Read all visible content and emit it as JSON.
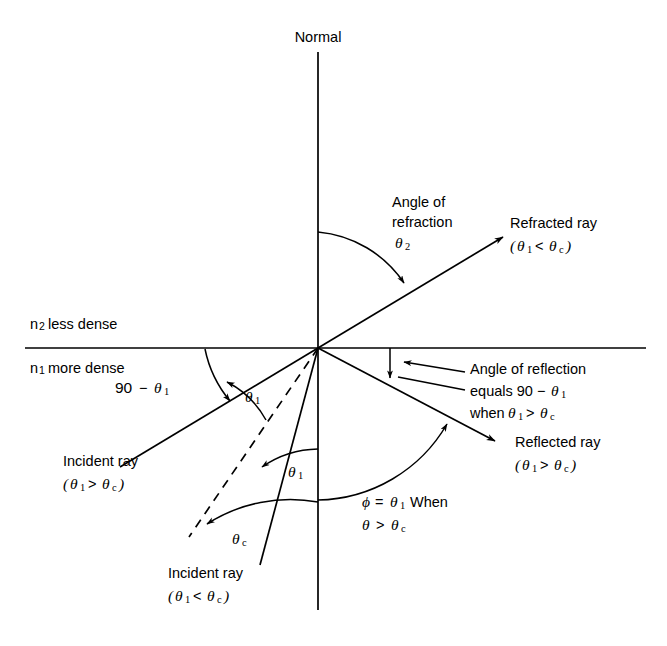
{
  "figure": {
    "background_color": "#ffffff",
    "stroke_color": "#000000"
  },
  "labels": {
    "normal": "Normal",
    "medium_upper": {
      "symbol": "n",
      "subscript": "2",
      "text": "less dense"
    },
    "medium_lower": {
      "symbol": "n",
      "subscript": "1",
      "text": "more dense"
    },
    "angle_of_refraction": {
      "line1": "Angle of",
      "line2": "refraction",
      "symbol": "θ",
      "subscript": "2"
    },
    "refracted_ray": {
      "line1": "Refracted ray",
      "open_paren": "(",
      "theta": "θ",
      "sub1": "1",
      "operator": "<",
      "theta2": "θ",
      "sub2": "c",
      "close_paren": ")"
    },
    "reflected_ray": {
      "line1": "Reflected ray",
      "open_paren": "(",
      "theta": "θ",
      "sub1": "1",
      "operator": ">",
      "theta2": "θ",
      "sub2": "c",
      "close_paren": ")"
    },
    "angle_of_reflection": {
      "line1": "Angle of reflection",
      "line2_prefix": "equals 90",
      "line2_minus": "−",
      "line2_theta": "θ",
      "line2_sub": "1",
      "line3_prefix": "when",
      "line3_theta": "θ",
      "line3_sub1": "1",
      "line3_op": ">",
      "line3_theta2": "θ",
      "line3_sub2": "c"
    },
    "ninety_minus_theta1": {
      "number": "90",
      "minus": "−",
      "theta": "θ",
      "subscript": "1"
    },
    "theta1_upper": {
      "theta": "θ",
      "subscript": "1"
    },
    "theta1_lower": {
      "theta": "θ",
      "subscript": "1"
    },
    "theta_c": {
      "theta": "θ",
      "subscript": "c"
    },
    "incident_ray_gt": {
      "line1": "Incident ray",
      "open_paren": "(",
      "theta": "θ",
      "sub1": "1",
      "operator": ">",
      "theta2": "θ",
      "sub2": "c",
      "close_paren": ")"
    },
    "incident_ray_lt": {
      "line1": "Incident ray",
      "open_paren": "(",
      "theta": "θ",
      "sub1": "1",
      "operator": "<",
      "theta2": "θ",
      "sub2": "c",
      "close_paren": ")"
    },
    "phi_note": {
      "phi": "ϕ",
      "equals": "=",
      "theta": "θ",
      "sub1": "1",
      "when": "When",
      "line2_theta": "θ",
      "line2_op": ">",
      "line2_theta2": "θ",
      "line2_sub": "c"
    }
  },
  "geometry": {
    "origin": {
      "x": 318,
      "y": 348
    },
    "normal_top_y": 52,
    "normal_bottom_y": 610,
    "interface_x1": 25,
    "interface_x2": 646,
    "interface_y": 348
  }
}
